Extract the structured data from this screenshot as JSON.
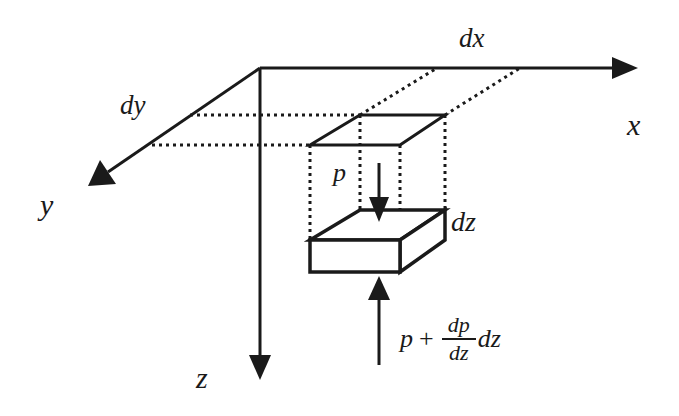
{
  "diagram": {
    "colors": {
      "ink": "#1a1a1a",
      "background": "#ffffff"
    },
    "axes": {
      "x": {
        "label": "x"
      },
      "y": {
        "label": "y"
      },
      "z": {
        "label": "z"
      }
    },
    "dimensions": {
      "dx": "dx",
      "dy": "dy",
      "dz": "dz"
    },
    "forces": {
      "top": {
        "label": "p",
        "direction": "down"
      },
      "bottom": {
        "direction": "up",
        "p": "p",
        "plus": "+",
        "numerator": "dp",
        "denominator": "dz",
        "trailing": "dz"
      }
    }
  }
}
